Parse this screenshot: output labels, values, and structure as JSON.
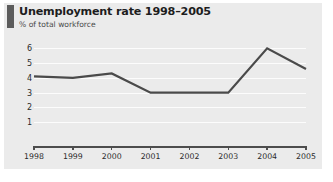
{
  "header": {
    "title": "Unemployment rate 1998–2005",
    "subtitle": "% of total workforce",
    "accent_color": "#5c5c5c"
  },
  "colors": {
    "card_background": "#ebebeb",
    "page_background": "#ffffff",
    "line": "#4a4a4a",
    "gridline": "#fcfcfc",
    "axis": "#4d4d4d",
    "text": "#2b2b2b",
    "title_text": "#1d1d1d"
  },
  "chart_data": {
    "type": "line",
    "title": "Unemployment rate 1998–2005",
    "subtitle": "% of total workforce",
    "xlabel": "",
    "ylabel": "% of total workforce",
    "categories": [
      "1998",
      "1999",
      "2000",
      "2001",
      "2002",
      "2003",
      "2004",
      "2005"
    ],
    "x": [
      1998,
      1999,
      2000,
      2001,
      2002,
      2003,
      2004,
      2005
    ],
    "values": [
      4.1,
      4.0,
      4.3,
      3.0,
      3.0,
      3.0,
      6.0,
      4.6
    ],
    "series": [
      {
        "name": "Unemployment rate",
        "values": [
          4.1,
          4.0,
          4.3,
          3.0,
          3.0,
          3.0,
          6.0,
          4.6
        ]
      }
    ],
    "ylim": [
      0,
      6.5
    ],
    "yticks": [
      1,
      2,
      3,
      4,
      5,
      6
    ],
    "ytick_labels": [
      "1",
      "2",
      "3",
      "4",
      "5",
      "6"
    ],
    "xlim": [
      1998,
      2005
    ],
    "grid": true,
    "grid_axis": "y",
    "legend": false,
    "legend_position": "none",
    "markers": false,
    "line_width": 2
  }
}
